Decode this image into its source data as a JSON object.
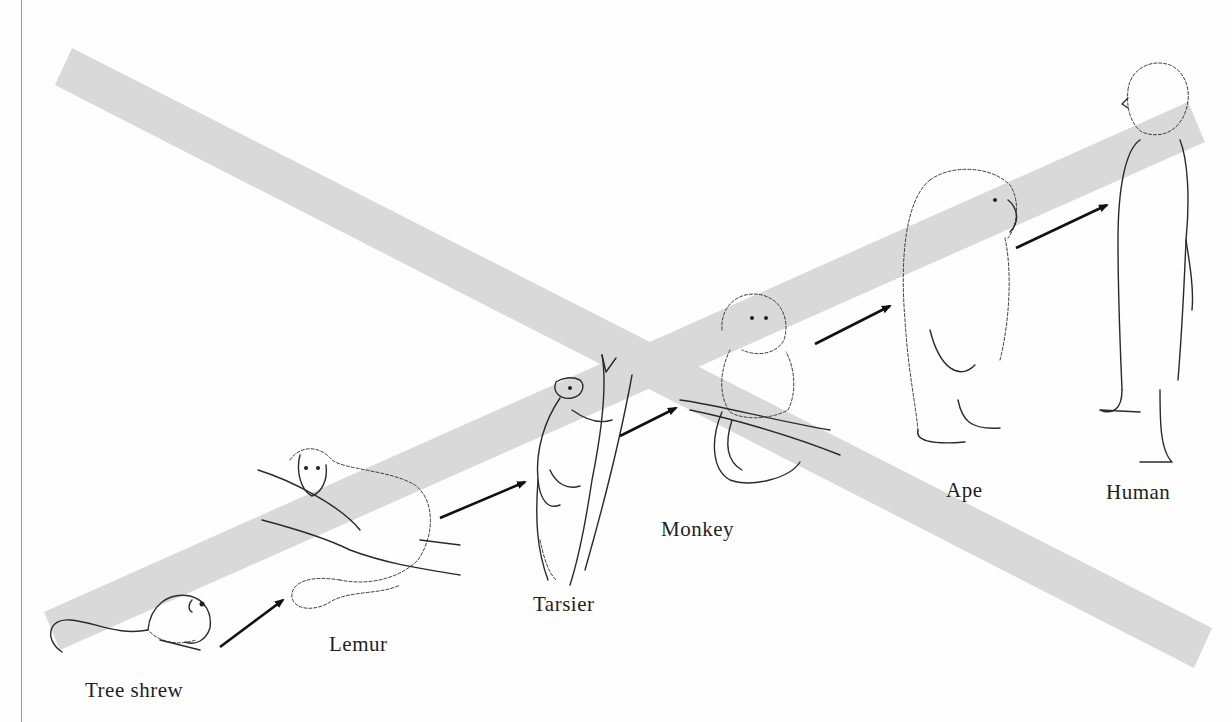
{
  "diagram": {
    "type": "crossed-out linear progression",
    "strike_color": "#d9d9d9",
    "line_color": "#2a2a2a",
    "stages": [
      {
        "label": "Tree shrew"
      },
      {
        "label": "Lemur"
      },
      {
        "label": "Tarsier"
      },
      {
        "label": "Monkey"
      },
      {
        "label": "Ape"
      },
      {
        "label": "Human"
      }
    ],
    "arrows": [
      {
        "from": "Tree shrew",
        "to": "Lemur"
      },
      {
        "from": "Lemur",
        "to": "Tarsier"
      },
      {
        "from": "Tarsier",
        "to": "Monkey"
      },
      {
        "from": "Monkey",
        "to": "Ape"
      },
      {
        "from": "Ape",
        "to": "Human"
      }
    ],
    "overlay": "large gray X crossing out the sequence"
  }
}
